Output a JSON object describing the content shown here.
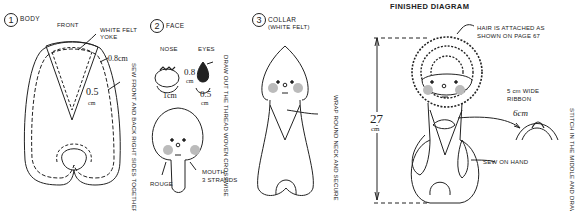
{
  "sections": [
    {
      "number": "1",
      "title": "BODY",
      "labels": {
        "front": "FRONT",
        "yoke": "WHITE FELT",
        "yoke2": "YOKE",
        "seam_top": "0.8cm",
        "seam_inner_num": "0.5",
        "seam_inner_unit": "cm",
        "side_note": "SEW FRONT AND BACK RIGHT SIDES TOGETHER"
      }
    },
    {
      "number": "2",
      "title": "FACE",
      "labels": {
        "nose": "NOSE",
        "eyes": "EYES",
        "nose_size": "1cm",
        "eye_h_num": "0.8",
        "eye_h_unit": "cm",
        "eye_w_num": "0.5",
        "eye_w_unit": "cm",
        "thread_note": "DRAW OUT THE THREAD WOVEN CROSSWISE",
        "mouth": "MOUTH,",
        "mouth2": "3 STRANDS",
        "rouge": "ROUGE"
      }
    },
    {
      "number": "3",
      "title": "COLLAR",
      "subtitle": "(WHITE FELT)",
      "labels": {
        "wrap_note": "WRAP ROUND NECK AND SECURE"
      }
    },
    {
      "title": "FINISHED DIAGRAM",
      "labels": {
        "hair": "HAIR IS ATTACHED AS",
        "hair2": "SHOWN ON PAGE 67",
        "height_num": "27",
        "height_unit": "cm",
        "ribbon": "5 cm WIDE",
        "ribbon2": "RIBBON",
        "ribbon_len": "6cm",
        "stitch_note": "STITCH IN THE MIDDLE AND DRAW",
        "hand": "SEW ON HAND"
      }
    }
  ]
}
